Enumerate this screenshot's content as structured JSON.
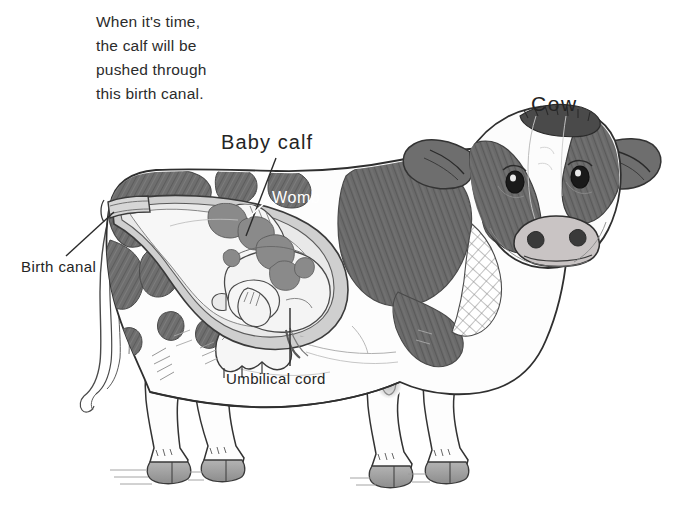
{
  "figure": {
    "title": "Cow",
    "caption": "When it's time,\nthe calf will be\npushed through\nthis birth canal.",
    "labels": {
      "cow": "Cow",
      "baby_calf": "Baby calf",
      "womb": "Womb",
      "birth_canal": "Birth canal",
      "umbilical_cord": "Umbilical cord"
    },
    "colors": {
      "background": "#ffffff",
      "ink": "#3a3a3a",
      "outline": "#2f2f2f",
      "patch_dark": "#6e6e6e",
      "patch_dark_2": "#656565",
      "hide_white": "#fefefe",
      "womb_wall": "#cfcfcf",
      "womb_lining": "#e6e6e6",
      "calf_body": "#f4f4f4",
      "calf_spot": "#8c8c8c",
      "hoof": "#9a9a9a",
      "muzzle": "#c9c4c4",
      "text_dark": "#242424",
      "text_light": "#ffffff",
      "caption_text": "#2b2b2b"
    }
  }
}
